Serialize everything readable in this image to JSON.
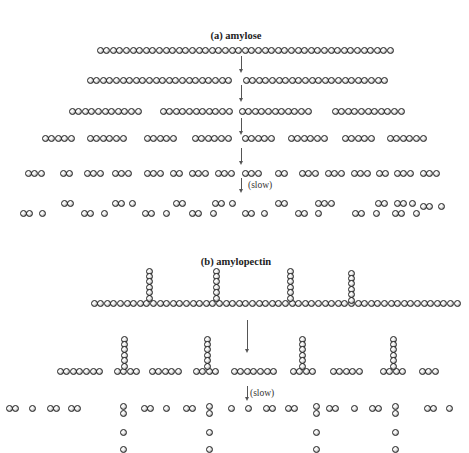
{
  "diagram": {
    "section_a": {
      "title": "(a) amylose",
      "title_pos": [
        236,
        30
      ],
      "slow_label": "(slow)",
      "slow_pos": [
        248,
        180
      ],
      "arrows": [
        [
          241,
          56,
          14
        ],
        [
          241,
          85,
          14
        ],
        [
          241,
          118,
          14
        ],
        [
          241,
          148,
          14
        ],
        [
          241,
          178,
          12
        ]
      ],
      "beads_spacing": 6.6,
      "rows": [
        {
          "y": 50,
          "segments": [
            [
              100,
              45
            ]
          ]
        },
        {
          "y": 80,
          "segments": [
            [
              90,
              22
            ],
            [
              246,
              22
            ]
          ]
        },
        {
          "y": 111,
          "segments": [
            [
              72,
              11
            ],
            [
              163,
              11
            ],
            [
              242,
              11
            ],
            [
              335,
              11
            ]
          ]
        },
        {
          "y": 138,
          "segments": [
            [
              45,
              5
            ],
            [
              90,
              6
            ],
            [
              147,
              5
            ],
            [
              195,
              6
            ],
            [
              245,
              5
            ],
            [
              291,
              6
            ],
            [
              345,
              5
            ],
            [
              390,
              6
            ]
          ]
        },
        {
          "y": 173,
          "segments": [
            [
              28,
              3
            ],
            [
              63,
              2
            ],
            [
              87,
              3
            ],
            [
              115,
              3
            ],
            [
              147,
              3
            ],
            [
              173,
              2
            ],
            [
              192,
              3
            ],
            [
              218,
              3
            ],
            [
              245,
              3
            ],
            [
              278,
              2
            ],
            [
              302,
              3
            ],
            [
              328,
              3
            ],
            [
              354,
              3
            ],
            [
              379,
              2
            ],
            [
              397,
              3
            ],
            [
              423,
              3
            ]
          ]
        },
        {
          "y": 203,
          "segments": [
            [
              64,
              2
            ],
            [
              115,
              2
            ],
            [
              132,
              1
            ],
            [
              176,
              2
            ],
            [
              215,
              2
            ],
            [
              232,
              1
            ],
            [
              278,
              2
            ],
            [
              318,
              2
            ],
            [
              331,
              1
            ],
            [
              378,
              2
            ],
            [
              397,
              2
            ],
            [
              412,
              1
            ]
          ]
        },
        {
          "y": 213,
          "segments": [
            [
              23,
              2
            ],
            [
              42,
              1
            ],
            [
              84,
              2
            ],
            [
              104,
              1
            ],
            [
              145,
              2
            ],
            [
              166,
              1
            ],
            [
              192,
              2
            ],
            [
              213,
              1
            ],
            [
              245,
              2
            ],
            [
              264,
              1
            ],
            [
              298,
              2
            ],
            [
              318,
              1
            ],
            [
              355,
              2
            ],
            [
              376,
              1
            ],
            [
              395,
              2
            ],
            [
              416,
              1
            ]
          ]
        },
        {
          "y": 206,
          "segments": [
            [
              423,
              2
            ],
            [
              441,
              1
            ]
          ]
        }
      ]
    },
    "section_b": {
      "title": "(b) amylopectin",
      "title_pos": [
        236,
        256
      ],
      "slow_label": "(slow)",
      "slow_pos": [
        250,
        388
      ],
      "arrows": [
        [
          247,
          320,
          30
        ],
        [
          247,
          386,
          12
        ]
      ],
      "beads_spacing": 6.6,
      "main_chain": {
        "y": 303,
        "x": 94,
        "count": 56
      },
      "branches": [
        {
          "x": 149,
          "y_top": 271,
          "count": 6
        },
        {
          "x": 216,
          "y_top": 271,
          "count": 6
        },
        {
          "x": 290,
          "y_top": 271,
          "count": 6
        },
        {
          "x": 351,
          "y_top": 273,
          "count": 6
        }
      ],
      "fragments_row": {
        "y": 371,
        "segments": [
          [
            60,
            7
          ],
          [
            117,
            4
          ],
          [
            152,
            5
          ],
          [
            196,
            4
          ],
          [
            234,
            7
          ],
          [
            293,
            4
          ],
          [
            333,
            5
          ],
          [
            383,
            4
          ],
          [
            422,
            3
          ]
        ]
      },
      "fragment_branches": [
        {
          "x": 124,
          "y_top": 339,
          "count": 6
        },
        {
          "x": 207,
          "y_top": 339,
          "count": 6
        },
        {
          "x": 302,
          "y_top": 339,
          "count": 6
        },
        {
          "x": 393,
          "y_top": 339,
          "count": 6
        }
      ],
      "product_row": {
        "y": 408,
        "segments": [
          [
            9,
            2
          ],
          [
            32,
            1
          ],
          [
            50,
            2
          ],
          [
            71,
            2
          ],
          [
            144,
            2
          ],
          [
            166,
            1
          ],
          [
            186,
            2
          ],
          [
            231,
            1
          ],
          [
            248,
            1
          ],
          [
            266,
            2
          ],
          [
            288,
            2
          ],
          [
            329,
            2
          ],
          [
            354,
            1
          ],
          [
            372,
            2
          ],
          [
            427,
            2
          ],
          [
            449,
            1
          ]
        ]
      },
      "product_stubs": [
        {
          "x": 123,
          "beads_y": [
            406,
            413,
            432,
            449
          ]
        },
        {
          "x": 209,
          "beads_y": [
            406,
            413,
            432,
            449
          ]
        },
        {
          "x": 316,
          "beads_y": [
            406,
            413,
            432,
            449
          ]
        },
        {
          "x": 395,
          "beads_y": [
            406,
            413,
            432,
            449
          ]
        }
      ]
    }
  }
}
